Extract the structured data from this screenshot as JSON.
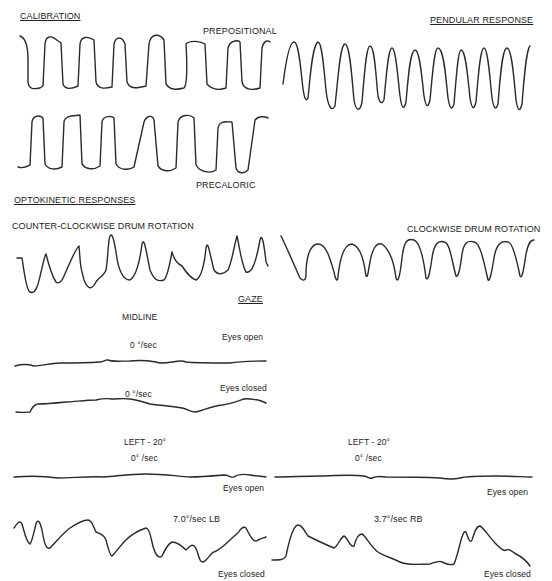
{
  "figure": {
    "sections": {
      "calibration": "CALIBRATION",
      "pendular": "PENDULAR  RESPONSE",
      "optokinetic": "OPTOKINETIC  RESPONSES",
      "gaze": "GAZE"
    },
    "calibration": {
      "prepositional_label": "PREPOSITIONAL",
      "precaloric_label": "PRECALORIC"
    },
    "optokinetic": {
      "ccw_label": "COUNTER-CLOCKWISE DRUM ROTATION",
      "cw_label": "CLOCKWISE DRUM ROTATION"
    },
    "gaze": {
      "midline_label": "MIDLINE",
      "midline_open_rate": "0  °/sec",
      "midline_open_state": "Eyes open",
      "midline_closed_rate": "0  °/sec",
      "midline_closed_state": "Eyes closed",
      "left_panel": {
        "position": "LEFT - 20°",
        "open_rate": "0° /sec",
        "open_state": "Eyes open",
        "closed_rate": "7.0°/sec  LB",
        "closed_state": "Eyes closed"
      },
      "right_panel": {
        "position": "LEFT - 20°",
        "open_rate": "0° /sec",
        "open_state": "Eyes open",
        "closed_rate": "3.7°/sec  RB",
        "closed_state": "Eyes closed"
      }
    }
  }
}
